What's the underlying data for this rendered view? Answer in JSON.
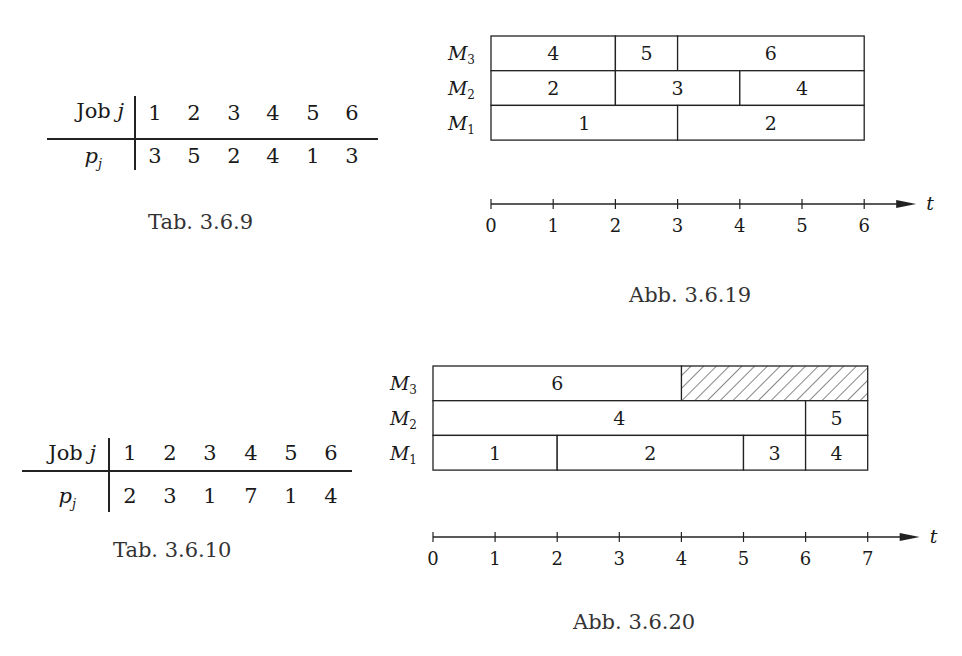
{
  "tables": [
    {
      "id": "tab-3-6-9",
      "caption": "Tab. 3.6.9",
      "row_header_job": "Job",
      "row_header_job_var": "j",
      "row_header_p": "p",
      "row_header_p_sub": "j",
      "jobs": [
        "1",
        "2",
        "3",
        "4",
        "5",
        "6"
      ],
      "p": [
        "3",
        "5",
        "2",
        "4",
        "1",
        "3"
      ]
    },
    {
      "id": "tab-3-6-10",
      "caption": "Tab. 3.6.10",
      "row_header_job": "Job",
      "row_header_job_var": "j",
      "row_header_p": "p",
      "row_header_p_sub": "j",
      "jobs": [
        "1",
        "2",
        "3",
        "4",
        "5",
        "6"
      ],
      "p": [
        "2",
        "3",
        "1",
        "7",
        "1",
        "4"
      ]
    }
  ],
  "chart_data": [
    {
      "type": "gantt",
      "title": "Abb. 3.6.19",
      "xlabel": "t",
      "xlim": [
        0,
        6
      ],
      "ticks": [
        "0",
        "1",
        "2",
        "3",
        "4",
        "5",
        "6"
      ],
      "machines": [
        "M3",
        "M2",
        "M1"
      ],
      "schedule": {
        "M3": [
          {
            "job": "4",
            "start": 0,
            "end": 2
          },
          {
            "job": "5",
            "start": 2,
            "end": 3
          },
          {
            "job": "6",
            "start": 3,
            "end": 6
          }
        ],
        "M2": [
          {
            "job": "2",
            "start": 0,
            "end": 2
          },
          {
            "job": "3",
            "start": 2,
            "end": 4
          },
          {
            "job": "4",
            "start": 4,
            "end": 6
          }
        ],
        "M1": [
          {
            "job": "1",
            "start": 0,
            "end": 3
          },
          {
            "job": "2",
            "start": 3,
            "end": 6
          }
        ]
      },
      "idle": []
    },
    {
      "type": "gantt",
      "title": "Abb. 3.6.20",
      "xlabel": "t",
      "xlim": [
        0,
        7
      ],
      "ticks": [
        "0",
        "1",
        "2",
        "3",
        "4",
        "5",
        "6",
        "7"
      ],
      "machines": [
        "M3",
        "M2",
        "M1"
      ],
      "schedule": {
        "M3": [
          {
            "job": "6",
            "start": 0,
            "end": 4
          }
        ],
        "M2": [
          {
            "job": "4",
            "start": 0,
            "end": 6
          },
          {
            "job": "5",
            "start": 6,
            "end": 7
          }
        ],
        "M1": [
          {
            "job": "1",
            "start": 0,
            "end": 2
          },
          {
            "job": "2",
            "start": 2,
            "end": 5
          },
          {
            "job": "3",
            "start": 5,
            "end": 6
          },
          {
            "job": "4",
            "start": 6,
            "end": 7
          }
        ]
      },
      "idle": [
        {
          "machine": "M3",
          "start": 4,
          "end": 7,
          "pattern": "hatched"
        }
      ]
    }
  ],
  "labels": {
    "machine_letter": "M",
    "m3_sub": "3",
    "m2_sub": "2",
    "m1_sub": "1",
    "axis_var": "t"
  }
}
